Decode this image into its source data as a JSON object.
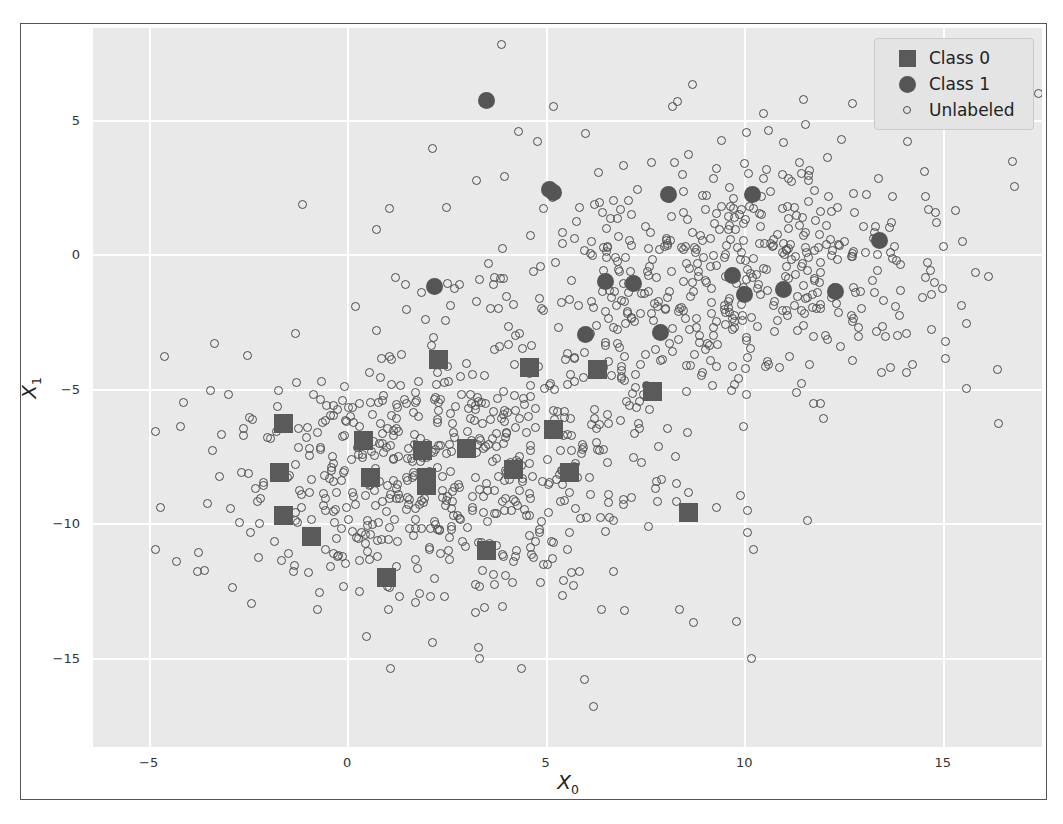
{
  "chart_data": {
    "type": "scatter",
    "title": "",
    "xlabel": "X_0",
    "ylabel": "X_1",
    "xlabel_text": "X",
    "xlabel_sub": "0",
    "ylabel_text": "X",
    "ylabel_sub": "1",
    "xlim": [
      -6.4,
      17.5
    ],
    "ylim": [
      -18.3,
      8.4
    ],
    "xticks": [
      -5,
      0,
      5,
      10,
      15
    ],
    "xticklabels": [
      "-5",
      "0",
      "5",
      "10",
      "15"
    ],
    "yticks": [
      5,
      0,
      -5,
      -10,
      -15
    ],
    "yticklabels": [
      "5",
      "0",
      "-5",
      "-10",
      "-15"
    ],
    "grid": true,
    "grid_color": "#ffffff",
    "axes_facecolor": "#e9e9e9",
    "figure_facecolor": "#ffffff",
    "legend_position": "upper right",
    "legend": [
      {
        "label": "Class 0",
        "marker": "square",
        "color": "#5a5a5a",
        "size": "large"
      },
      {
        "label": "Class 1",
        "marker": "circle",
        "color": "#555555",
        "size": "large"
      },
      {
        "label": "Unlabeled",
        "marker": "open-circle",
        "color": "#4c4c4c",
        "size": "small"
      }
    ],
    "series": [
      {
        "name": "Class 0",
        "marker": "square",
        "color": "#5a5a5a",
        "points": [
          [
            2.3,
            -3.9
          ],
          [
            4.6,
            -4.2
          ],
          [
            6.3,
            -4.3
          ],
          [
            7.7,
            -5.1
          ],
          [
            -1.6,
            -6.3
          ],
          [
            0.4,
            -6.9
          ],
          [
            1.9,
            -7.3
          ],
          [
            3.0,
            -7.2
          ],
          [
            5.2,
            -6.5
          ],
          [
            -1.7,
            -8.1
          ],
          [
            0.6,
            -8.3
          ],
          [
            2.0,
            -8.6
          ],
          [
            4.2,
            -8.0
          ],
          [
            5.6,
            -8.1
          ],
          [
            -1.6,
            -9.7
          ],
          [
            8.6,
            -9.6
          ],
          [
            -0.9,
            -10.5
          ],
          [
            3.5,
            -11.0
          ],
          [
            1.0,
            -12.0
          ],
          [
            2.0,
            -8.3
          ]
        ]
      },
      {
        "name": "Class 1",
        "marker": "circle",
        "color": "#555555",
        "points": [
          [
            3.5,
            5.7
          ],
          [
            5.1,
            2.4
          ],
          [
            8.1,
            2.2
          ],
          [
            10.2,
            2.2
          ],
          [
            13.4,
            0.5
          ],
          [
            2.2,
            -1.2
          ],
          [
            6.5,
            -1.0
          ],
          [
            7.2,
            -1.1
          ],
          [
            9.7,
            -0.8
          ],
          [
            11.0,
            -1.3
          ],
          [
            10.0,
            -1.5
          ],
          [
            12.3,
            -1.4
          ],
          [
            6.0,
            -3.0
          ],
          [
            7.9,
            -2.9
          ],
          [
            5.2,
            2.3
          ]
        ]
      },
      {
        "name": "Unlabeled",
        "marker": "open-circle",
        "color": "#4c4c4c",
        "n_points": 1100,
        "description": "Two overlapping Gaussian clusters: a lower-left cluster centered near (2.5, -8) and an upper-right cluster centered near (9.5, -0.5), each with substantial spread; a few outliers scattered to the far left, far right, top and bottom."
      }
    ]
  }
}
